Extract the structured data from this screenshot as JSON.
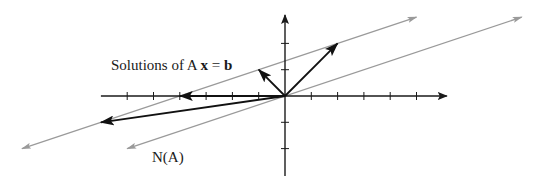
{
  "figure": {
    "labels": {
      "solutions_prefix": "Solutions of A ",
      "solutions_x": "x",
      "solutions_eq": " = ",
      "solutions_b": "b",
      "null_space": "N(A)"
    },
    "colors": {
      "axis": "#1a1a1a",
      "vector": "#111111",
      "line": "#9a9a9a"
    },
    "axes": {
      "x_range": [
        -7,
        6
      ],
      "y_range": [
        -3,
        3
      ],
      "x_ticks": [
        -6,
        -5,
        -4,
        -3,
        -2,
        -1,
        1,
        2,
        3,
        4,
        5
      ],
      "y_ticks": [
        -2,
        -1,
        1,
        2
      ]
    },
    "lines": [
      {
        "name": "solution-set-line",
        "from": [
          -10,
          -2
        ],
        "to": [
          5,
          3
        ]
      },
      {
        "name": "null-space-line",
        "from": [
          -6,
          -2
        ],
        "to": [
          9,
          3
        ]
      }
    ],
    "vectors": [
      {
        "name": "solution-vector-1",
        "to": [
          2,
          2
        ]
      },
      {
        "name": "solution-vector-2",
        "to": [
          -1,
          1
        ]
      },
      {
        "name": "solution-vector-3",
        "to": [
          -4,
          0
        ]
      },
      {
        "name": "solution-vector-4",
        "to": [
          -7,
          -1
        ]
      }
    ]
  }
}
